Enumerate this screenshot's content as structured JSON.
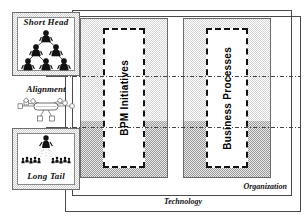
{
  "diagram": {
    "left_column": {
      "short_head": {
        "label": "Short Head",
        "icon": "org-pyramid-icon",
        "icon_description": "hierarchical pyramid of three rows of people: one at top, two in middle, three at bottom"
      },
      "alignment": {
        "label": "Alignment",
        "icon": "network-hub-icon",
        "icon_description": "central rounded node connected to surrounding small square and diamond nodes"
      },
      "long_tail": {
        "label": "Long Tail",
        "icon": "crowd-icon",
        "icon_description": "single highlighted person above a wide crowd of many small figures"
      }
    },
    "frames": {
      "outer": {
        "label": "Technology"
      },
      "inner": {
        "label": "Organization"
      }
    },
    "panels": [
      {
        "label": "BPM Initiatives"
      },
      {
        "label": "Business Processes"
      }
    ],
    "colors": {
      "frame_stroke": "#4a4a4a",
      "panel_stroke": "#6a6a6a",
      "band_light": "#d5d5d5",
      "band_dark": "#9a9a9a",
      "dash_core": "#111111",
      "text": "#111111"
    }
  }
}
